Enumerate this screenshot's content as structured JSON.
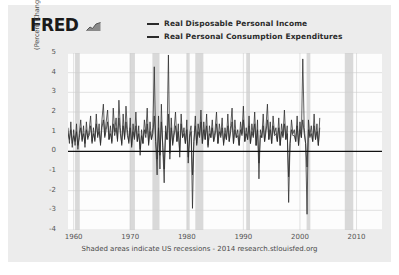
{
  "brand": {
    "name": "FRED",
    "mark_icon": "line-chart-icon"
  },
  "legend": {
    "position": "top-center",
    "items": [
      {
        "label": "Real Disposable Personal Income",
        "color": "#2a2a2a"
      },
      {
        "label": "Real Personal Consumption Expenditures",
        "color": "#2a2a2a"
      }
    ]
  },
  "footer": {
    "text": "Shaded areas indicate US recessions - 2014 research.stlouisfed.org"
  },
  "chart_data": {
    "type": "line",
    "title": "",
    "subtitle": "",
    "xlabel": "",
    "ylabel": "(Percent Change of (Billions of Chained 2009 Dollars))",
    "xlim": [
      1959.0,
      2014.5
    ],
    "ylim": [
      -4,
      5
    ],
    "yticks": [
      5,
      4,
      3,
      2,
      1,
      0,
      -1,
      -2,
      -3,
      -4
    ],
    "xticks": [
      1960,
      1970,
      1980,
      1990,
      2000,
      2010
    ],
    "grid": true,
    "zero_line": 0,
    "legend_position": "top-center",
    "shaded_regions_label": "US recessions",
    "shaded_regions": [
      [
        1960.25,
        1961.08
      ],
      [
        1969.92,
        1970.83
      ],
      [
        1973.92,
        1975.17
      ],
      [
        1980.0,
        1980.5
      ],
      [
        1981.5,
        1982.92
      ],
      [
        1990.5,
        1991.17
      ],
      [
        2001.17,
        2001.83
      ],
      [
        2007.92,
        2009.42
      ]
    ],
    "series": [
      {
        "name": "Real Disposable Personal Income",
        "color": "#2a2a2a",
        "frequency": "quarterly",
        "x_start": 1959.0,
        "x_step": 0.25,
        "values": [
          1.2,
          0.4,
          1.5,
          0.2,
          1.1,
          0.3,
          1.4,
          0.1,
          0.9,
          1.6,
          0.5,
          1.3,
          0.2,
          1.5,
          0.6,
          1.1,
          1.8,
          0.4,
          1.2,
          0.5,
          1.9,
          0.7,
          1.4,
          0.3,
          1.6,
          2.4,
          0.8,
          1.5,
          2.1,
          0.6,
          1.3,
          0.4,
          2.2,
          1.0,
          1.7,
          0.5,
          2.6,
          1.2,
          0.3,
          1.9,
          0.6,
          2.3,
          1.1,
          0.4,
          1.7,
          0.2,
          1.4,
          0.7,
          2.0,
          0.5,
          1.3,
          -0.2,
          1.1,
          0.4,
          1.6,
          0.9,
          2.2,
          0.3,
          1.5,
          0.6,
          1.2,
          4.3,
          0.5,
          -1.2,
          1.8,
          -0.9,
          2.4,
          0.2,
          -1.6,
          1.3,
          0.6,
          4.9,
          -0.4,
          1.7,
          0.3,
          1.1,
          2.0,
          0.5,
          1.4,
          -0.3,
          1.9,
          0.7,
          1.2,
          0.4,
          1.6,
          -0.6,
          0.9,
          1.3,
          -2.9,
          0.5,
          1.8,
          0.3,
          1.4,
          0.8,
          2.1,
          0.4,
          1.5,
          0.6,
          1.9,
          0.2,
          1.3,
          0.7,
          1.6,
          0.5,
          1.1,
          2.0,
          0.4,
          1.4,
          0.8,
          1.7,
          0.3,
          1.2,
          0.6,
          1.9,
          0.5,
          1.3,
          2.2,
          0.4,
          1.6,
          0.7,
          1.1,
          0.3,
          1.5,
          0.9,
          2.3,
          0.5,
          1.2,
          0.6,
          1.8,
          0.4,
          1.4,
          0.8,
          2.0,
          0.3,
          1.6,
          -1.4,
          1.1,
          0.7,
          1.9,
          0.5,
          1.3,
          2.4,
          0.6,
          1.5,
          0.4,
          1.8,
          0.9,
          1.2,
          0.5,
          1.7,
          0.3,
          1.4,
          0.8,
          2.1,
          0.6,
          1.3,
          -2.6,
          0.4,
          1.6,
          0.9,
          1.1,
          0.5,
          1.8,
          0.3,
          1.5,
          0.7,
          4.7,
          1.2,
          0.4,
          -3.2,
          1.6,
          0.8,
          1.3,
          0.5,
          1.9,
          0.6,
          1.4,
          0.3,
          1.7
        ]
      },
      {
        "name": "Real Personal Consumption Expenditures",
        "color": "#2a2a2a",
        "frequency": "quarterly",
        "x_start": 1959.0,
        "x_step": 0.25,
        "values": [
          0.9,
          0.6,
          1.1,
          0.4,
          0.8,
          0.5,
          1.0,
          0.3,
          0.7,
          1.2,
          0.6,
          0.9,
          0.4,
          1.1,
          0.7,
          0.8,
          1.3,
          0.5,
          0.9,
          0.6,
          1.4,
          0.8,
          1.0,
          0.4,
          1.2,
          1.6,
          0.7,
          1.1,
          1.5,
          0.6,
          0.9,
          0.5,
          1.4,
          0.8,
          1.2,
          0.6,
          1.7,
          0.9,
          0.4,
          1.3,
          0.7,
          1.5,
          0.8,
          0.5,
          1.2,
          0.3,
          1.0,
          0.6,
          1.3,
          0.5,
          0.9,
          0.1,
          0.8,
          0.4,
          1.1,
          0.7,
          1.4,
          0.4,
          1.0,
          0.6,
          0.9,
          1.8,
          0.5,
          -0.4,
          1.2,
          -0.2,
          1.5,
          0.3,
          -0.9,
          1.0,
          0.6,
          1.9,
          -0.1,
          1.2,
          0.4,
          0.8,
          1.3,
          0.5,
          1.0,
          0.0,
          1.4,
          0.7,
          0.9,
          0.4,
          1.1,
          -0.3,
          0.7,
          1.0,
          -1.2,
          0.5,
          1.3,
          0.4,
          1.0,
          0.7,
          1.5,
          0.4,
          1.1,
          0.6,
          1.3,
          0.3,
          0.9,
          0.7,
          1.2,
          0.5,
          0.8,
          1.4,
          0.4,
          1.0,
          0.7,
          1.2,
          0.4,
          0.9,
          0.6,
          1.3,
          0.5,
          1.0,
          1.5,
          0.4,
          1.1,
          0.7,
          0.8,
          0.3,
          1.1,
          0.8,
          1.6,
          0.5,
          0.9,
          0.6,
          1.3,
          0.4,
          1.0,
          0.7,
          1.4,
          0.3,
          1.1,
          -0.6,
          0.8,
          0.7,
          1.3,
          0.5,
          1.0,
          1.6,
          0.6,
          1.1,
          0.4,
          1.3,
          0.8,
          0.9,
          0.5,
          1.2,
          0.3,
          1.0,
          0.7,
          1.4,
          0.6,
          0.9,
          -1.3,
          0.4,
          1.1,
          0.8,
          0.8,
          0.5,
          1.3,
          0.3,
          1.1,
          0.7,
          1.6,
          0.9,
          0.4,
          -0.8,
          1.1,
          0.7,
          0.9,
          0.5,
          1.3,
          0.6,
          1.0,
          0.3,
          1.2
        ]
      }
    ]
  }
}
